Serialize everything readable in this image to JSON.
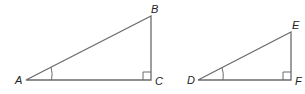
{
  "figure": {
    "triangles": [
      {
        "name": "ABC",
        "vertices": {
          "A": {
            "label": "A",
            "x": 26,
            "y": 80
          },
          "B": {
            "label": "B",
            "x": 151,
            "y": 16
          },
          "C": {
            "label": "C",
            "x": 151,
            "y": 80
          }
        },
        "right_angle_at": "C",
        "marked_angle_at": "A"
      },
      {
        "name": "DEF",
        "vertices": {
          "D": {
            "label": "D",
            "x": 198,
            "y": 80
          },
          "E": {
            "label": "E",
            "x": 291,
            "y": 32
          },
          "F": {
            "label": "F",
            "x": 291,
            "y": 80
          }
        },
        "right_angle_at": "F",
        "marked_angle_at": "D"
      }
    ],
    "colors": {
      "stroke": "#6b6b6b",
      "label": "#222222"
    }
  }
}
